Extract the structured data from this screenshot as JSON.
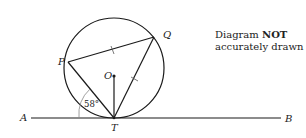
{
  "diagram": {
    "labels": {
      "A": "A",
      "B": "B",
      "T": "T",
      "P": "P",
      "Q": "Q",
      "O": "O"
    },
    "angle_label": "58°",
    "note": {
      "prefix": "Diagram ",
      "emphasis": "NOT",
      "line2": "accurately drawn"
    },
    "stroke_color": "#1a1a1a"
  }
}
